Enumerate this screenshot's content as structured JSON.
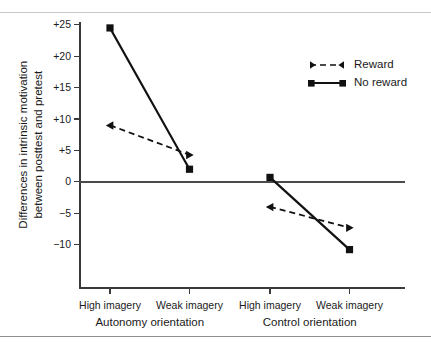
{
  "chart_data": {
    "type": "line",
    "title": "",
    "xlabel": "",
    "ylabel": "Differences in intrinsic motivation between posttest and pretest",
    "ylabel_line1": "Differences in intrinsic motivation",
    "ylabel_line2": "between posttest and pretest",
    "categories": [
      "High imagery",
      "Weak imagery",
      "High imagery",
      "Weak imagery"
    ],
    "groups": [
      {
        "name": "Autonomy orientation",
        "categories": [
          "High imagery",
          "Weak imagery"
        ]
      },
      {
        "name": "Control orientation",
        "categories": [
          "High imagery",
          "Weak imagery"
        ]
      }
    ],
    "series": [
      {
        "name": "Reward",
        "marker": "triangle",
        "linestyle": "dashed",
        "color": "#111111",
        "values": [
          9.0,
          4.3,
          -4.0,
          -7.3
        ]
      },
      {
        "name": "No reward",
        "marker": "square",
        "linestyle": "solid",
        "color": "#111111",
        "values": [
          24.5,
          2.0,
          0.7,
          -10.8
        ]
      }
    ],
    "yticks": [
      25,
      20,
      15,
      10,
      5,
      0,
      -5,
      -10
    ],
    "ytick_labels": [
      "+25",
      "+20",
      "+15",
      "+10",
      "+5",
      "0",
      "−5",
      "−10"
    ],
    "ylim": [
      -16.5,
      26.0
    ],
    "grid": false,
    "zero_line": true,
    "legend_position": "top-right",
    "legend_entries": [
      "Reward",
      "No reward"
    ]
  },
  "legend": {
    "reward_label": "Reward",
    "noreward_label": "No reward"
  },
  "axis": {
    "y_title_line1": "Differences in intrinsic motivation",
    "y_title_line2": "between posttest and pretest",
    "x_labels": [
      "High imagery",
      "Weak imagery",
      "High imagery",
      "Weak imagery"
    ],
    "group_labels": [
      "Autonomy orientation",
      "Control orientation"
    ],
    "y_labels": [
      "+25",
      "+20",
      "+15",
      "+10",
      "+5",
      "0",
      "−5",
      "−10"
    ]
  }
}
